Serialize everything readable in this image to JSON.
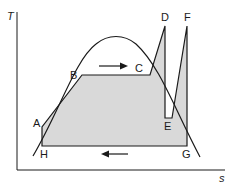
{
  "diagram": {
    "type": "T-s diagram",
    "axes": {
      "y_label": "T",
      "x_label": "s"
    },
    "points": {
      "A": "A",
      "B": "B",
      "C": "C",
      "D": "D",
      "E": "E",
      "F": "F",
      "G": "G",
      "H": "H"
    },
    "arrows": [
      {
        "id": "top-arrow",
        "direction": "right"
      },
      {
        "id": "bottom-arrow",
        "direction": "left"
      }
    ],
    "colors": {
      "line": "#1a1a1a",
      "fill": "#d9d9d9",
      "background": "#ffffff"
    }
  }
}
